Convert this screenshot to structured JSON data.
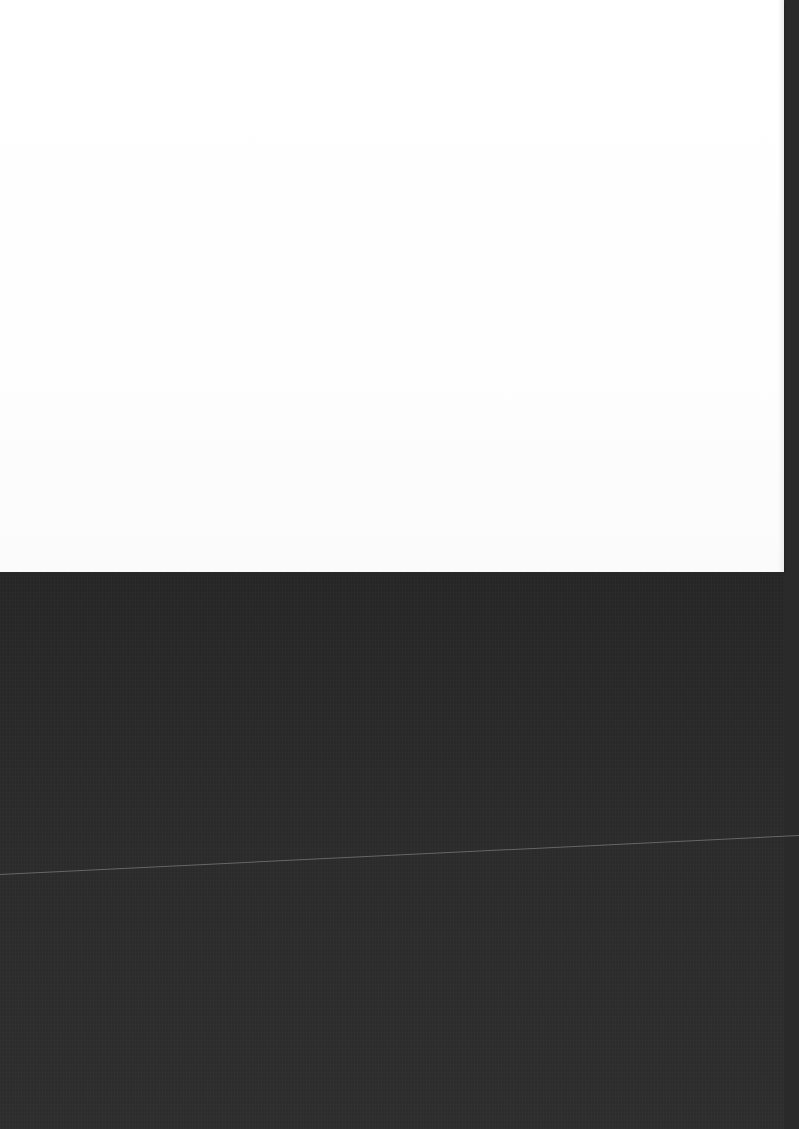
{
  "scene": {
    "description": "Blank white sheet of paper on a dark textured surface",
    "paper": {
      "color": "#ffffff",
      "text": ""
    },
    "surface": {
      "color": "#2a2a2a"
    },
    "line": {
      "color": "#8a8a8a"
    }
  }
}
